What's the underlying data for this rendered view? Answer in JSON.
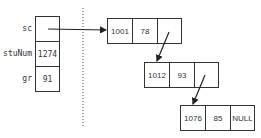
{
  "struct": {
    "fields": [
      {
        "label": "sc",
        "value": ""
      },
      {
        "label": "stuNum",
        "value": "1274"
      },
      {
        "label": "gr",
        "value": "91"
      }
    ]
  },
  "list": {
    "nodes": [
      {
        "id": "1001",
        "score": "78",
        "next": ""
      },
      {
        "id": "1012",
        "score": "93",
        "next": ""
      },
      {
        "id": "1076",
        "score": "85",
        "next": "NULL"
      }
    ]
  }
}
